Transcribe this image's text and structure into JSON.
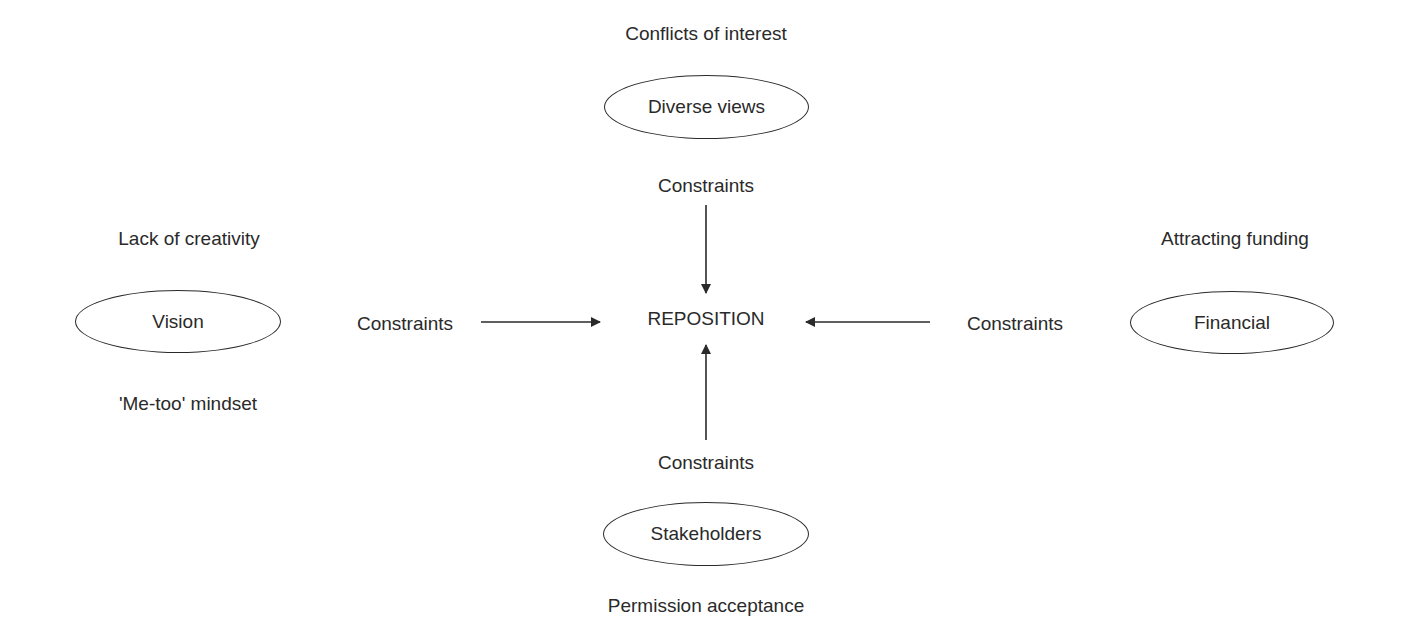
{
  "diagram": {
    "center": {
      "label": "REPOSITION"
    },
    "constraint_label": "Constraints",
    "nodes": {
      "top": {
        "label": "Diverse views",
        "annotation_above": "Conflicts of interest"
      },
      "left": {
        "label": "Vision",
        "annotation_above": "Lack of creativity",
        "annotation_below": "'Me-too' mindset"
      },
      "right": {
        "label": "Financial",
        "annotation_above": "Attracting funding"
      },
      "bottom": {
        "label": "Stakeholders",
        "annotation_below": "Permission acceptance"
      }
    },
    "edges": [
      {
        "from": "top",
        "to": "center",
        "label": "Constraints"
      },
      {
        "from": "left",
        "to": "center",
        "label": "Constraints"
      },
      {
        "from": "right",
        "to": "center",
        "label": "Constraints"
      },
      {
        "from": "bottom",
        "to": "center",
        "label": "Constraints"
      }
    ],
    "colors": {
      "stroke": "#2a2a2a",
      "background": "#ffffff"
    }
  }
}
